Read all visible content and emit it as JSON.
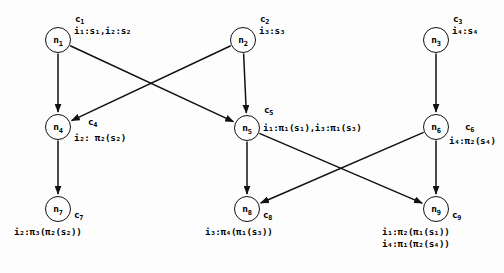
{
  "diagram": {
    "type": "directed-graph",
    "title": "",
    "background_color": "#fdfdfd",
    "stroke_color": "#111111",
    "nodes": [
      {
        "id": "n1",
        "label": "n",
        "sub": "1",
        "cx": 58,
        "cy": 40,
        "cid": "c",
        "cid_sub": "1",
        "annotations": [
          "i₁:s₁,i₂:s₂"
        ]
      },
      {
        "id": "n2",
        "label": "n",
        "sub": "2",
        "cx": 243,
        "cy": 40,
        "cid": "c",
        "cid_sub": "2",
        "annotations": [
          "i₃:s₃"
        ]
      },
      {
        "id": "n3",
        "label": "n",
        "sub": "3",
        "cx": 436,
        "cy": 40,
        "cid": "c",
        "cid_sub": "3",
        "annotations": [
          "i₄:s₄"
        ]
      },
      {
        "id": "n4",
        "label": "n",
        "sub": "4",
        "cx": 58,
        "cy": 127,
        "cid": "c",
        "cid_sub": "4",
        "annotations": [
          "i₂: π₂(s₂)"
        ]
      },
      {
        "id": "n5",
        "label": "n",
        "sub": "5",
        "cx": 247,
        "cy": 128,
        "cid": "c",
        "cid_sub": "5",
        "annotations": [
          "i₁:π₁(s₁),i₃:π₁(s₃)"
        ]
      },
      {
        "id": "n6",
        "label": "n",
        "sub": "6",
        "cx": 436,
        "cy": 127,
        "cid": "c",
        "cid_sub": "6",
        "annotations": [
          "i₄:π₂(s₄)"
        ]
      },
      {
        "id": "n7",
        "label": "n",
        "sub": "7",
        "cx": 58,
        "cy": 209,
        "cid": "c",
        "cid_sub": "7",
        "annotations": [
          "i₂:π₃(π₂(s₂))"
        ]
      },
      {
        "id": "n8",
        "label": "n",
        "sub": "8",
        "cx": 247,
        "cy": 209,
        "cid": "c",
        "cid_sub": "8",
        "annotations": [
          "i₃:π₄(π₁(s₃))"
        ]
      },
      {
        "id": "n9",
        "label": "n",
        "sub": "9",
        "cx": 436,
        "cy": 209,
        "cid": "c",
        "cid_sub": "9",
        "annotations": [
          "i₁:π₂(π₁(s₁))",
          "i₄:π₁(π₂(s₄))"
        ]
      }
    ],
    "edges": [
      {
        "from": "n1",
        "to": "n4"
      },
      {
        "from": "n1",
        "to": "n5"
      },
      {
        "from": "n2",
        "to": "n4"
      },
      {
        "from": "n2",
        "to": "n5"
      },
      {
        "from": "n3",
        "to": "n6"
      },
      {
        "from": "n4",
        "to": "n7"
      },
      {
        "from": "n5",
        "to": "n8"
      },
      {
        "from": "n5",
        "to": "n9"
      },
      {
        "from": "n6",
        "to": "n8"
      },
      {
        "from": "n6",
        "to": "n9"
      }
    ],
    "annotation_positions": {
      "n1": {
        "cid_x": 75,
        "cid_y": 14,
        "text_x": 74,
        "text_y": 25
      },
      "n2": {
        "cid_x": 260,
        "cid_y": 14,
        "text_x": 259,
        "text_y": 25
      },
      "n3": {
        "cid_x": 453,
        "cid_y": 14,
        "text_x": 452,
        "text_y": 25
      },
      "n4": {
        "cid_x": 88,
        "cid_y": 117,
        "text_x": 74,
        "text_y": 132
      },
      "n5": {
        "cid_x": 264,
        "cid_y": 105,
        "text_x": 263,
        "text_y": 122
      },
      "n6": {
        "cid_x": 465,
        "cid_y": 122,
        "text_x": 449,
        "text_y": 135
      },
      "n7": {
        "cid_x": 74,
        "cid_y": 210,
        "text_x": 14,
        "text_y": 226
      },
      "n8": {
        "cid_x": 263,
        "cid_y": 210,
        "text_x": 205,
        "text_y": 226
      },
      "n9": {
        "cid_x": 452,
        "cid_y": 210,
        "text_x": 382,
        "text_y": 226
      }
    }
  }
}
